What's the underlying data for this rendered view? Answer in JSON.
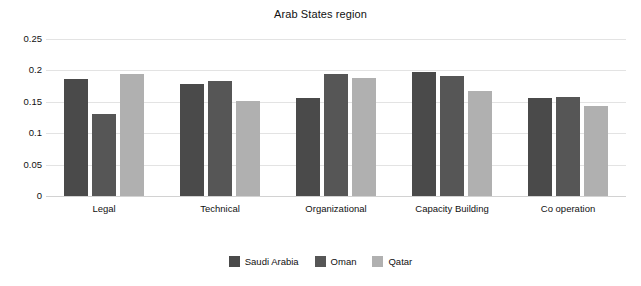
{
  "chart_data": {
    "type": "bar",
    "title": "Arab States region",
    "xlabel": "",
    "ylabel": "",
    "ylim": [
      0,
      0.25
    ],
    "yticks": [
      0.25,
      0.2,
      0.15,
      0.1,
      0.05,
      0
    ],
    "ytick_labels": [
      "0.25",
      "0.2",
      "0.15",
      "0.1",
      "0.05",
      "0"
    ],
    "grid": true,
    "legend_position": "bottom",
    "categories": [
      "Legal",
      "Technical",
      "Organizational",
      "Capacity Building",
      "Co operation"
    ],
    "series": [
      {
        "name": "Saudi Arabia",
        "color": "#4a4a4a",
        "values": [
          0.186,
          0.178,
          0.156,
          0.198,
          0.156
        ]
      },
      {
        "name": "Oman",
        "color": "#565656",
        "values": [
          0.131,
          0.183,
          0.195,
          0.191,
          0.158
        ]
      },
      {
        "name": "Qatar",
        "color": "#b0b0b0",
        "values": [
          0.194,
          0.152,
          0.188,
          0.167,
          0.144
        ]
      }
    ]
  }
}
